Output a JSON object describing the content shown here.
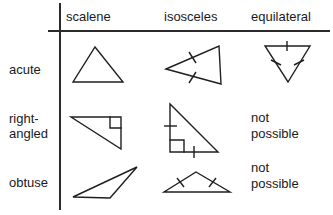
{
  "figure": {
    "line_color": "#2b2b2b",
    "stroke_color": "#1f1f1f",
    "background": "#ffffff"
  },
  "columns": [
    {
      "label": "scalene"
    },
    {
      "label": "isosceles"
    },
    {
      "label": "equilateral"
    }
  ],
  "rows": [
    {
      "label": "acute"
    },
    {
      "label_line1": "right-",
      "label_line2": "angled"
    },
    {
      "label": "obtuse"
    }
  ],
  "cells": {
    "acute_scalene": {
      "kind": "triangle",
      "name": "acute-scalene-triangle",
      "ticks": 0,
      "right_angle": false
    },
    "acute_isosceles": {
      "kind": "triangle",
      "name": "acute-isosceles-triangle",
      "ticks": 2,
      "right_angle": false
    },
    "acute_equilateral": {
      "kind": "triangle",
      "name": "acute-equilateral-triangle",
      "ticks": 3,
      "right_angle": false
    },
    "right_scalene": {
      "kind": "triangle",
      "name": "right-angled-scalene-triangle",
      "ticks": 0,
      "right_angle": true
    },
    "right_isosceles": {
      "kind": "triangle",
      "name": "right-angled-isosceles-triangle",
      "ticks": 2,
      "right_angle": true
    },
    "right_equilateral": {
      "kind": "text",
      "line1": "not",
      "line2": "possible"
    },
    "obtuse_scalene": {
      "kind": "triangle",
      "name": "obtuse-scalene-triangle",
      "ticks": 0,
      "right_angle": false
    },
    "obtuse_isosceles": {
      "kind": "triangle",
      "name": "obtuse-isosceles-triangle",
      "ticks": 2,
      "right_angle": false
    },
    "obtuse_equilateral": {
      "kind": "text",
      "line1": "not",
      "line2": "possible"
    }
  }
}
